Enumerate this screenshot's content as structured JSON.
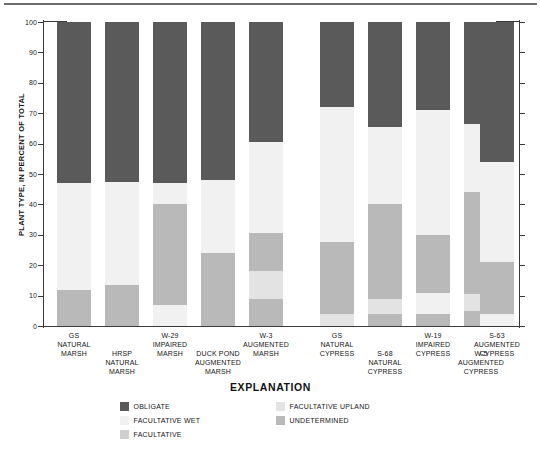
{
  "figure": {
    "y_axis_title": "PLANT TYPE, IN PERCENT OF TOTAL",
    "explanation_title": "EXPLANATION"
  },
  "legend": {
    "items": [
      {
        "label": "OBLIGATE",
        "color": "#5a5a5a",
        "col": 0,
        "row": 0
      },
      {
        "label": "FACULTATIVE WET",
        "color": "#f1f1f1",
        "col": 0,
        "row": 1
      },
      {
        "label": "FACULTATIVE",
        "color": "#cfcfcf",
        "col": 0,
        "row": 2
      },
      {
        "label": "FACULTATIVE UPLAND",
        "color": "#e3e3e3",
        "col": 1,
        "row": 0
      },
      {
        "label": "UNDETERMINED",
        "color": "#b9b9b9",
        "col": 1,
        "row": 1
      }
    ]
  },
  "chart_data": {
    "type": "bar",
    "title": "",
    "xlabel": "",
    "ylabel": "PLANT TYPE, IN PERCENT OF TOTAL",
    "ylim": [
      0,
      100
    ],
    "yticks": [
      0,
      10,
      20,
      30,
      40,
      50,
      60,
      70,
      80,
      90,
      100
    ],
    "grid": false,
    "stacked": true,
    "legend_position": "bottom",
    "series": [
      {
        "name": "OBLIGATE",
        "color": "#5a5a5a",
        "values": [
          53.0,
          52.5,
          53.0,
          52.0,
          39.5,
          28.0,
          34.5,
          29.0,
          33.5,
          46.0
        ]
      },
      {
        "name": "FACULTATIVE WET",
        "color": "#f1f1f1",
        "values": [
          35.0,
          34.0,
          7.0,
          28.0,
          30.0,
          44.5,
          25.5,
          41.0,
          22.5,
          33.0
        ]
      },
      {
        "name": "FACULTATIVE",
        "color": "#cfcfcf",
        "values": [
          0.0,
          0.0,
          0.0,
          0.0,
          0.0,
          0.0,
          0.0,
          0.0,
          0.0,
          0.0
        ]
      },
      {
        "name": "FACULTATIVE UPLAND",
        "color": "#e3e3e3",
        "values": [
          0.0,
          0.0,
          0.0,
          0.0,
          9.0,
          0.0,
          5.0,
          0.0,
          5.5,
          0.0
        ]
      },
      {
        "name": "UNDETERMINED",
        "color": "#b9b9b9",
        "values": [
          12.0,
          13.5,
          33.0,
          24.0,
          12.0,
          23.5,
          31.0,
          26.0,
          34.0,
          17.0
        ]
      }
    ],
    "categories": [
      "GS NATURAL MARSH",
      "HRSP NATURAL MARSH",
      "W-29 IMPAIRED MARSH",
      "DUCK POND AUGMENTED MARSH",
      "W-3 AUGMENTED MARSH",
      "GS NATURAL CYPRESS",
      "S-68 NATURAL CYPRESS",
      "W-19 IMPAIRED CYPRESS",
      "W-5 AUGMENTED CYPRESS",
      "S-63 AUGMENTED CYPRESS"
    ],
    "bars": [
      {
        "id": "gs-natural-marsh",
        "label_lines": [
          "GS",
          "NATURAL",
          "MARSH"
        ],
        "label_row": 0,
        "x": 57,
        "stack": [
          {
            "series": "UNDETERMINED",
            "from": 0,
            "to": 12,
            "color": "#b9b9b9"
          },
          {
            "series": "FACULTATIVE WET",
            "from": 12,
            "to": 47,
            "color": "#f1f1f1"
          },
          {
            "series": "OBLIGATE",
            "from": 47,
            "to": 100,
            "color": "#5a5a5a"
          }
        ]
      },
      {
        "id": "hrsp-natural-marsh",
        "label_lines": [
          "HRSP",
          "NATURAL",
          "MARSH"
        ],
        "label_row": 1,
        "x": 105,
        "stack": [
          {
            "series": "UNDETERMINED",
            "from": 0,
            "to": 13.5,
            "color": "#b9b9b9"
          },
          {
            "series": "FACULTATIVE WET",
            "from": 13.5,
            "to": 47.5,
            "color": "#f1f1f1"
          },
          {
            "series": "OBLIGATE",
            "from": 47.5,
            "to": 100,
            "color": "#5a5a5a"
          }
        ]
      },
      {
        "id": "w-29-impaired-marsh",
        "label_lines": [
          "W-29",
          "IMPAIRED",
          "MARSH"
        ],
        "label_row": 0,
        "x": 153,
        "stack": [
          {
            "series": "FACULTATIVE WET",
            "from": 0,
            "to": 7,
            "color": "#f1f1f1"
          },
          {
            "series": "UNDETERMINED",
            "from": 7,
            "to": 40,
            "color": "#b9b9b9"
          },
          {
            "series": "FACULTATIVE WET",
            "from": 40,
            "to": 47,
            "color": "#f1f1f1"
          },
          {
            "series": "OBLIGATE",
            "from": 47,
            "to": 100,
            "color": "#5a5a5a"
          }
        ]
      },
      {
        "id": "duck-pond-augmented-marsh",
        "label_lines": [
          "DUCK POND",
          "AUGMENTED",
          "MARSH"
        ],
        "label_row": 1,
        "x": 201,
        "stack": [
          {
            "series": "UNDETERMINED",
            "from": 0,
            "to": 24,
            "color": "#b9b9b9"
          },
          {
            "series": "FACULTATIVE WET",
            "from": 24,
            "to": 48,
            "color": "#f1f1f1"
          },
          {
            "series": "OBLIGATE",
            "from": 48,
            "to": 100,
            "color": "#5a5a5a"
          }
        ]
      },
      {
        "id": "w-3-augmented-marsh",
        "label_lines": [
          "W-3",
          "AUGMENTED",
          "MARSH"
        ],
        "label_row": 0,
        "x": 249,
        "stack": [
          {
            "series": "UNDETERMINED",
            "from": 0,
            "to": 9,
            "color": "#b9b9b9"
          },
          {
            "series": "FACULTATIVE UPLAND",
            "from": 9,
            "to": 18,
            "color": "#e3e3e3"
          },
          {
            "series": "UNDETERMINED",
            "from": 18,
            "to": 30.5,
            "color": "#b9b9b9"
          },
          {
            "series": "FACULTATIVE WET",
            "from": 30.5,
            "to": 60.5,
            "color": "#f1f1f1"
          },
          {
            "series": "OBLIGATE",
            "from": 60.5,
            "to": 100,
            "color": "#5a5a5a"
          }
        ]
      },
      {
        "id": "gs-natural-cypress",
        "label_lines": [
          "GS",
          "NATURAL",
          "CYPRESS"
        ],
        "label_row": 0,
        "x": 320,
        "stack": [
          {
            "series": "FACULTATIVE UPLAND",
            "from": 0,
            "to": 4,
            "color": "#e3e3e3"
          },
          {
            "series": "UNDETERMINED",
            "from": 4,
            "to": 27.5,
            "color": "#b9b9b9"
          },
          {
            "series": "FACULTATIVE WET",
            "from": 27.5,
            "to": 72,
            "color": "#f1f1f1"
          },
          {
            "series": "OBLIGATE",
            "from": 72,
            "to": 100,
            "color": "#5a5a5a"
          }
        ]
      },
      {
        "id": "s-68-natural-cypress",
        "label_lines": [
          "S-68",
          "NATURAL",
          "CYPRESS"
        ],
        "label_row": 1,
        "x": 368,
        "stack": [
          {
            "series": "UNDETERMINED",
            "from": 0,
            "to": 4,
            "color": "#b9b9b9"
          },
          {
            "series": "FACULTATIVE UPLAND",
            "from": 4,
            "to": 9,
            "color": "#e3e3e3"
          },
          {
            "series": "UNDETERMINED",
            "from": 9,
            "to": 40,
            "color": "#b9b9b9"
          },
          {
            "series": "FACULTATIVE WET",
            "from": 40,
            "to": 65.5,
            "color": "#f1f1f1"
          },
          {
            "series": "OBLIGATE",
            "from": 65.5,
            "to": 100,
            "color": "#5a5a5a"
          }
        ]
      },
      {
        "id": "w-19-impaired-cypress",
        "label_lines": [
          "W-19",
          "IMPAIRED",
          "CYPRESS"
        ],
        "label_row": 0,
        "x": 416,
        "stack": [
          {
            "series": "UNDETERMINED",
            "from": 0,
            "to": 4,
            "color": "#b9b9b9"
          },
          {
            "series": "FACULTATIVE WET",
            "from": 4,
            "to": 11,
            "color": "#f1f1f1"
          },
          {
            "series": "UNDETERMINED",
            "from": 11,
            "to": 30,
            "color": "#b9b9b9"
          },
          {
            "series": "FACULTATIVE WET",
            "from": 30,
            "to": 71,
            "color": "#f1f1f1"
          },
          {
            "series": "OBLIGATE",
            "from": 71,
            "to": 100,
            "color": "#5a5a5a"
          }
        ]
      },
      {
        "id": "w-5-augmented-cypress",
        "label_lines": [
          "W-5",
          "AUGMENTED",
          "CYPRESS"
        ],
        "label_row": 1,
        "x": 464,
        "stack": [
          {
            "series": "UNDETERMINED",
            "from": 0,
            "to": 5,
            "color": "#b9b9b9"
          },
          {
            "series": "FACULTATIVE UPLAND",
            "from": 5,
            "to": 10.5,
            "color": "#e3e3e3"
          },
          {
            "series": "UNDETERMINED",
            "from": 10.5,
            "to": 44,
            "color": "#b9b9b9"
          },
          {
            "series": "FACULTATIVE WET",
            "from": 44,
            "to": 66.5,
            "color": "#f1f1f1"
          },
          {
            "series": "OBLIGATE",
            "from": 66.5,
            "to": 100,
            "color": "#5a5a5a"
          }
        ]
      },
      {
        "id": "s-63-augmented-cypress",
        "label_lines": [
          "S-63",
          "AUGMENTED",
          "CYPRESS"
        ],
        "label_row": 0,
        "x": 480,
        "stack": [
          {
            "series": "FACULTATIVE WET",
            "from": 0,
            "to": 4,
            "color": "#f1f1f1"
          },
          {
            "series": "UNDETERMINED",
            "from": 4,
            "to": 21,
            "color": "#b9b9b9"
          },
          {
            "series": "FACULTATIVE WET",
            "from": 21,
            "to": 54,
            "color": "#f1f1f1"
          },
          {
            "series": "OBLIGATE",
            "from": 54,
            "to": 100,
            "color": "#5a5a5a"
          }
        ]
      }
    ]
  }
}
